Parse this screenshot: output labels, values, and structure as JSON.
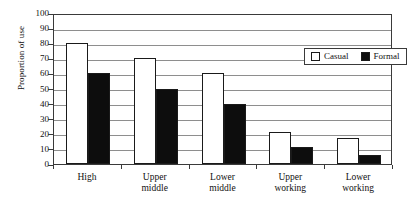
{
  "chart_data": {
    "type": "bar",
    "title": "",
    "xlabel": "",
    "ylabel": "Proportion of use",
    "ylim": [
      0,
      100
    ],
    "ytick_step": 10,
    "yticks": [
      0,
      10,
      20,
      30,
      40,
      50,
      60,
      70,
      80,
      90,
      100
    ],
    "ytick_labels": [
      "0",
      "10",
      "20",
      "30",
      "40",
      "50",
      "60",
      "70",
      "80",
      "90",
      "100"
    ],
    "grid": "horizontal",
    "legend_position": "upper-right-inside",
    "categories": [
      "High",
      "Upper middle",
      "Lower middle",
      "Upper working",
      "Lower working"
    ],
    "category_lines": [
      [
        "High"
      ],
      [
        "Upper",
        "middle"
      ],
      [
        "Lower",
        "middle"
      ],
      [
        "Upper",
        "working"
      ],
      [
        "Lower",
        "working"
      ]
    ],
    "series": [
      {
        "name": "Casual",
        "color": "#ffffff",
        "edge": "#1a1a1a",
        "values": [
          80,
          70,
          60,
          21,
          17
        ]
      },
      {
        "name": "Formal",
        "color": "#0d0d0d",
        "edge": "#1a1a1a",
        "values": [
          60,
          50,
          40,
          11,
          6
        ]
      }
    ]
  },
  "legend": {
    "entries": [
      {
        "label": "Casual",
        "swatch": "casual"
      },
      {
        "label": "Formal",
        "swatch": "formal"
      }
    ]
  }
}
